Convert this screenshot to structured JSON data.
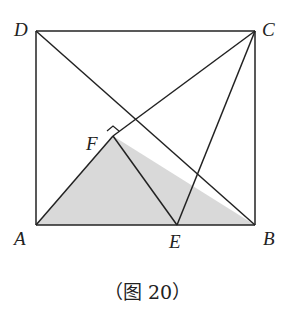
{
  "figure": {
    "caption": "（图 20）",
    "shade_color": "#d9d9d9",
    "line_color": "#222222",
    "points": {
      "A": "A",
      "B": "B",
      "C": "C",
      "D": "D",
      "E": "E",
      "F": "F"
    }
  }
}
